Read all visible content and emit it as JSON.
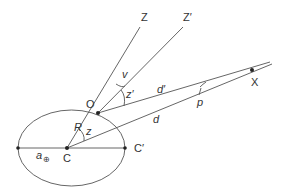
{
  "diagram": {
    "points": {
      "O": {
        "label": "O",
        "x": 98,
        "y": 113
      },
      "C": {
        "label": "C",
        "x": 67,
        "y": 148
      },
      "C_prime": {
        "label": "C′",
        "x": 125,
        "y": 148
      },
      "left": {
        "x": 18,
        "y": 148
      },
      "X": {
        "label": "X",
        "x": 252,
        "y": 70
      },
      "Z": {
        "label": "Z",
        "x": 140,
        "y": 27
      },
      "Z_prime": {
        "label": "Z′",
        "x": 183,
        "y": 27
      }
    },
    "labels": {
      "Z": "Z",
      "Z_prime": "Z′",
      "O": "O",
      "X": "X",
      "C": "C",
      "C_prime": "C′",
      "v": "v",
      "z_prime": "z′",
      "z": "z",
      "R": "R",
      "d_prime": "d′",
      "d": "d",
      "p": "p",
      "a_earth": "a",
      "earth_symbol": "⊕"
    },
    "colors": {
      "line": "#555555",
      "text": "#333333",
      "background": "#ffffff"
    }
  }
}
